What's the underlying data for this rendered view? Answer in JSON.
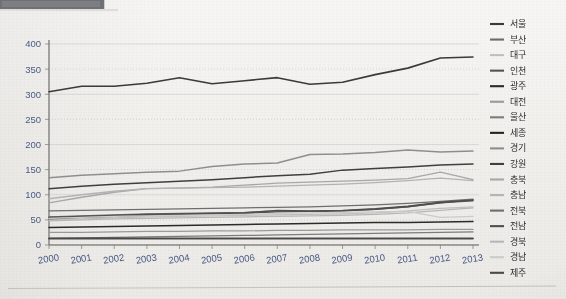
{
  "window": {
    "toolbar_name": "cropped-toolbar-strip"
  },
  "chart_data": {
    "type": "line",
    "title": "",
    "subtitle": "",
    "xlabel": "",
    "ylabel": "",
    "x": [
      2000,
      2001,
      2002,
      2003,
      2004,
      2005,
      2006,
      2007,
      2008,
      2009,
      2010,
      2011,
      2012,
      2013
    ],
    "categories": [
      "2000",
      "2001",
      "2002",
      "2003",
      "2004",
      "2005",
      "2006",
      "2007",
      "2008",
      "2009",
      "2010",
      "2011",
      "2012",
      "2013"
    ],
    "xlim": [
      2000,
      2013
    ],
    "ylim": [
      0,
      400
    ],
    "yticks": [
      0,
      50,
      100,
      150,
      200,
      250,
      300,
      350,
      400
    ],
    "ytick_labels": [
      "0",
      "50",
      "100",
      "150",
      "200",
      "250",
      "300",
      "350",
      "400"
    ],
    "grid": true,
    "legend_position": "right",
    "series": [
      {
        "name": "서울",
        "color": "#3a3a3a",
        "width": 1.6,
        "values": [
          305,
          316,
          316,
          322,
          333,
          321,
          327,
          333,
          320,
          324,
          339,
          352,
          372,
          374
        ]
      },
      {
        "name": "부산",
        "color": "#6b6b6b",
        "width": 1.3,
        "values": [
          56,
          58,
          60,
          62,
          63,
          64,
          65,
          68,
          67,
          68,
          71,
          76,
          84,
          88
        ]
      },
      {
        "name": "대구",
        "color": "#c0c0c0",
        "width": 1.2,
        "values": [
          50,
          52,
          54,
          56,
          57,
          58,
          59,
          60,
          61,
          62,
          64,
          68,
          73,
          76
        ]
      },
      {
        "name": "인천",
        "color": "#545454",
        "width": 1.4,
        "values": [
          52,
          55,
          57,
          59,
          61,
          62,
          63,
          66,
          67,
          68,
          71,
          76,
          84,
          90
        ]
      },
      {
        "name": "광주",
        "color": "#2b2b2b",
        "width": 1.5,
        "values": [
          35,
          36,
          37,
          38,
          39,
          40,
          41,
          42,
          43,
          44,
          45,
          45,
          46,
          47
        ]
      },
      {
        "name": "대전",
        "color": "#9a9a9a",
        "width": 1.2,
        "values": [
          25,
          25,
          26,
          27,
          27,
          28,
          28,
          29,
          29,
          30,
          30,
          30,
          31,
          31
        ]
      },
      {
        "name": "울산",
        "color": "#7d7d7d",
        "width": 1.3,
        "values": [
          13,
          14,
          15,
          16,
          17,
          18,
          19,
          20,
          21,
          22,
          23,
          24,
          25,
          26
        ]
      },
      {
        "name": "세종",
        "color": "#232323",
        "width": 1.5,
        "values": [
          13,
          13,
          13,
          13,
          13,
          13,
          13,
          13,
          13,
          13,
          13,
          13,
          13,
          13
        ]
      },
      {
        "name": "경기",
        "color": "#8f8f8f",
        "width": 1.5,
        "values": [
          134,
          139,
          142,
          145,
          147,
          156,
          161,
          163,
          180,
          181,
          184,
          189,
          185,
          187
        ]
      },
      {
        "name": "강원",
        "color": "#3f3f3f",
        "width": 1.5,
        "values": [
          112,
          117,
          121,
          124,
          127,
          130,
          134,
          138,
          141,
          149,
          152,
          155,
          159,
          161
        ]
      },
      {
        "name": "충북",
        "color": "#a8a8a8",
        "width": 1.3,
        "values": [
          84,
          95,
          105,
          112,
          113,
          115,
          119,
          123,
          125,
          127,
          129,
          132,
          145,
          130
        ]
      },
      {
        "name": "충남",
        "color": "#b4b4b4",
        "width": 1.3,
        "values": [
          92,
          100,
          107,
          112,
          113,
          114,
          115,
          117,
          119,
          121,
          124,
          128,
          133,
          128
        ]
      },
      {
        "name": "전북",
        "color": "#6f6f6f",
        "width": 1.3,
        "values": [
          68,
          69,
          70,
          71,
          72,
          73,
          74,
          75,
          76,
          78,
          80,
          83,
          87,
          91
        ]
      },
      {
        "name": "전남",
        "color": "#4e4e4e",
        "width": 1.4,
        "values": [
          55,
          57,
          59,
          61,
          62,
          63,
          64,
          69,
          68,
          69,
          72,
          77,
          85,
          89
        ]
      },
      {
        "name": "경북",
        "color": "#b8b8b8",
        "width": 1.2,
        "values": [
          48,
          50,
          52,
          53,
          54,
          55,
          56,
          57,
          58,
          59,
          61,
          64,
          69,
          74
        ]
      },
      {
        "name": "경남",
        "color": "#cccccc",
        "width": 1.2,
        "values": [
          53,
          55,
          57,
          58,
          59,
          60,
          61,
          63,
          64,
          65,
          66,
          67,
          55,
          57
        ]
      },
      {
        "name": "제주",
        "color": "#4a4a4a",
        "width": 1.4,
        "values": [
          13,
          13,
          13,
          13,
          13,
          13,
          13,
          13,
          13,
          13,
          13,
          13,
          13,
          13
        ]
      }
    ]
  },
  "legend": {
    "items": [
      {
        "label": "서울",
        "color": "#3a3a3a"
      },
      {
        "label": "부산",
        "color": "#6b6b6b"
      },
      {
        "label": "대구",
        "color": "#c0c0c0"
      },
      {
        "label": "인천",
        "color": "#545454"
      },
      {
        "label": "광주",
        "color": "#2b2b2b"
      },
      {
        "label": "대전",
        "color": "#9a9a9a"
      },
      {
        "label": "울산",
        "color": "#7d7d7d"
      },
      {
        "label": "세종",
        "color": "#232323"
      },
      {
        "label": "경기",
        "color": "#8f8f8f"
      },
      {
        "label": "강원",
        "color": "#3f3f3f"
      },
      {
        "label": "충북",
        "color": "#a8a8a8"
      },
      {
        "label": "충남",
        "color": "#b4b4b4"
      },
      {
        "label": "전북",
        "color": "#6f6f6f"
      },
      {
        "label": "전남",
        "color": "#4e4e4e"
      },
      {
        "label": "경북",
        "color": "#b8b8b8"
      },
      {
        "label": "경남",
        "color": "#cccccc"
      },
      {
        "label": "제주",
        "color": "#4a4a4a"
      }
    ]
  },
  "colors": {
    "axis": "#636363",
    "grid": "#c9c9c9",
    "tick_text": "#4a5b86",
    "legend_text": "#2f2f2f",
    "page_background": "#f1f0ed"
  }
}
